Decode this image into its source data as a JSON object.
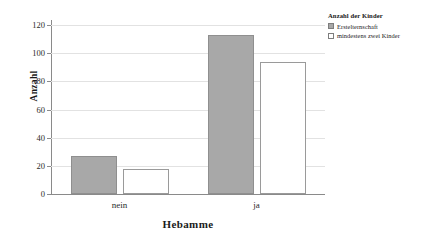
{
  "chart_data": {
    "type": "bar",
    "title": "",
    "categories": [
      "nein",
      "ja"
    ],
    "series": [
      {
        "name": "Erstelternschaft",
        "values": [
          27,
          113
        ]
      },
      {
        "name": "mindestens zwei Kinder",
        "values": [
          18,
          94
        ]
      }
    ],
    "xlabel": "Hebamme",
    "ylabel": "Anzahl",
    "ylim": [
      0,
      120
    ],
    "yticks": [
      0,
      20,
      40,
      60,
      80,
      100,
      120
    ],
    "ytick_labels": [
      "0",
      "20",
      "40",
      "60",
      "80",
      "100",
      "120"
    ],
    "grid": true,
    "legend_title": "Anzahl der Kinder",
    "legend_position": "top-right",
    "colors": {
      "series_0": "#a8a8a8",
      "series_1": "#ffffff",
      "border": "#8f8f8f",
      "gridline": "#e2e2e2",
      "axis": "#8a8a8a"
    }
  }
}
